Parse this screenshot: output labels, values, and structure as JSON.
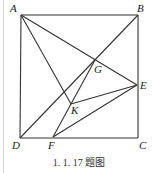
{
  "figure": {
    "caption": "1. 1. 17 题图",
    "points": {
      "A": {
        "label": "A",
        "x": 21,
        "y": 15
      },
      "B": {
        "label": "B",
        "x": 138,
        "y": 15
      },
      "C": {
        "label": "C",
        "x": 138,
        "y": 138
      },
      "D": {
        "label": "D",
        "x": 20,
        "y": 138
      },
      "E": {
        "label": "E",
        "x": 137,
        "y": 85
      },
      "F": {
        "label": "F",
        "x": 53,
        "y": 137
      },
      "G": {
        "label": "G",
        "x": 95,
        "y": 60
      },
      "K": {
        "label": "K",
        "x": 71,
        "y": 104
      }
    },
    "segments": [
      [
        "A",
        "B"
      ],
      [
        "B",
        "C"
      ],
      [
        "C",
        "D"
      ],
      [
        "D",
        "A"
      ],
      [
        "B",
        "D"
      ],
      [
        "A",
        "E"
      ],
      [
        "A",
        "K"
      ],
      [
        "F",
        "G"
      ],
      [
        "K",
        "E"
      ],
      [
        "F",
        "E"
      ]
    ],
    "line_color": "#333333"
  }
}
